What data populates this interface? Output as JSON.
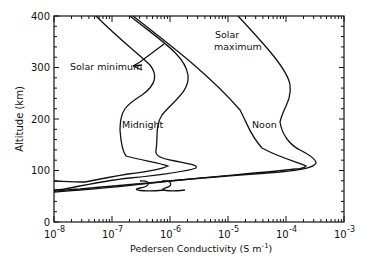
{
  "chart_data": {
    "type": "line",
    "title": "",
    "xlabel": "Pedersen Conductivity (S m⁻¹)",
    "ylabel": "Altitude (km)",
    "xscale": "log",
    "xlim": [
      1e-08,
      0.001
    ],
    "ylim": [
      0,
      400
    ],
    "x_ticks": [
      "10^-8",
      "10^-7",
      "10^-6",
      "10^-5",
      "10^-4",
      "10^-3"
    ],
    "y_ticks": [
      0,
      100,
      200,
      300,
      400
    ],
    "grid": false,
    "annotations": [
      "Solar minimum",
      "Solar maximum",
      "Midnight",
      "Noon"
    ],
    "series": [
      {
        "name": "Midnight, solar minimum",
        "points": [
          [
            3e-08,
            400
          ],
          [
            2e-07,
            320
          ],
          [
            2.5e-07,
            270
          ],
          [
            1.1e-07,
            220
          ],
          [
            1e-07,
            180
          ],
          [
            1.5e-07,
            140
          ],
          [
            8e-07,
            115
          ],
          [
            3e-07,
            100
          ],
          [
            2e-08,
            82
          ],
          [
            1e-08,
            80
          ]
        ]
      },
      {
        "name": "Midnight, solar maximum",
        "points": [
          [
            1.2e-07,
            400
          ],
          [
            1.2e-06,
            300
          ],
          [
            5e-07,
            230
          ],
          [
            3e-07,
            180
          ],
          [
            3.5e-07,
            140
          ],
          [
            1.7e-06,
            115
          ],
          [
            5e-07,
            100
          ],
          [
            1e-08,
            60
          ]
        ]
      },
      {
        "name": "Noon, solar minimum",
        "points": [
          [
            4e-07,
            400
          ],
          [
            1e-05,
            290
          ],
          [
            4e-05,
            210
          ],
          [
            7e-05,
            185
          ],
          [
            6e-05,
            165
          ],
          [
            0.0002,
            125
          ],
          [
            0.00015,
            115
          ],
          [
            1e-08,
            60
          ]
        ]
      },
      {
        "name": "Noon, solar maximum",
        "points": [
          [
            1.5e-05,
            400
          ],
          [
            0.0001,
            290
          ],
          [
            0.00012,
            230
          ],
          [
            7e-05,
            185
          ],
          [
            0.0001,
            165
          ],
          [
            0.0003,
            120
          ],
          [
            0.0001,
            112
          ],
          [
            1e-08,
            62
          ]
        ]
      }
    ]
  },
  "labels": {
    "solar_min": "Solar minimum",
    "solar_max_1": "Solar",
    "solar_max_2": "maximum",
    "midnight": "Midnight",
    "noon": "Noon",
    "xlabel": "Pedersen Conductivity (S m",
    "xlabel_sup": "-1",
    "xlabel_end": ")",
    "ylabel": "Altitude (km)",
    "y0": "0",
    "y100": "100",
    "y200": "200",
    "y300": "300",
    "y400": "400",
    "xbase": "10",
    "xe8": "-8",
    "xe7": "-7",
    "xe6": "-6",
    "xe5": "-5",
    "xe4": "-4",
    "xe3": "-3"
  }
}
